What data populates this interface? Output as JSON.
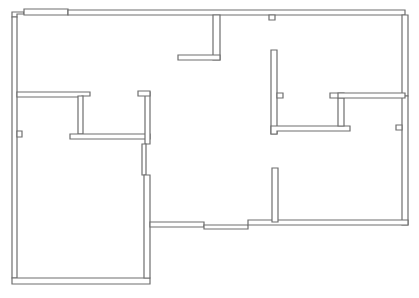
{
  "diagram": {
    "type": "floor-plan",
    "width": 419,
    "height": 298,
    "colors": {
      "wall_stroke": "#6e6e6e",
      "wall_fill": "#ffffff",
      "background": "#ffffff"
    },
    "walls": [
      {
        "name": "top-wall-left-notch",
        "points": "12,12 24,12 24,14 17,14 17,17 12,17"
      },
      {
        "name": "top-wall-raised",
        "points": "24,9 68,9 68,15 24,15"
      },
      {
        "name": "top-wall-main",
        "points": "68,10 405,10 405,15 68,15"
      },
      {
        "name": "right-wall-upper",
        "points": "402,15 408,15 408,96 402,96"
      },
      {
        "name": "right-wall-lower",
        "points": "402,96 408,96 408,225 402,225"
      },
      {
        "name": "left-wall",
        "points": "12,17 17,17 17,278 12,278"
      },
      {
        "name": "left-wall-jamb",
        "points": "17,131 22,131 22,137 17,137"
      },
      {
        "name": "bottom-wall-left",
        "points": "12,278 150,278 150,284 12,284"
      },
      {
        "name": "horizontal-wall-upper-left",
        "points": "17,92 90,92 90,96 82,96 82,97 17,97"
      },
      {
        "name": "closet-left-vertical",
        "points": "78,96 83,96 83,134 78,134"
      },
      {
        "name": "closet-bottom",
        "points": "70,134 150,134 150,139 70,139"
      },
      {
        "name": "closet-right-vertical",
        "points": "145,92 150,92 150,144 145,144"
      },
      {
        "name": "closet-right-cap",
        "points": "138,91 150,91 150,96 138,96"
      },
      {
        "name": "central-left-jamb-upper",
        "points": "142,144 146,144 146,175 142,175"
      },
      {
        "name": "central-left-vertical",
        "points": "144,175 150,175 150,278 144,278"
      },
      {
        "name": "bottom-hall-wall",
        "points": "150,222 204,222 204,227 150,227"
      },
      {
        "name": "bottom-door-threshold",
        "points": "204,225 248,225 248,229 204,229"
      },
      {
        "name": "bottom-wall-right",
        "points": "248,220 408,220 408,225 248,225"
      },
      {
        "name": "bottom-right-stub",
        "points": "272,168 278,168 278,222 272,222"
      },
      {
        "name": "upper-center-vertical",
        "points": "213,15 220,15 220,60 213,60"
      },
      {
        "name": "upper-center-horizontal",
        "points": "178,55 220,55 220,60 178,60"
      },
      {
        "name": "top-wall-jamb",
        "points": "269,15 275,15 275,20 269,20"
      },
      {
        "name": "right-closet-vertical",
        "points": "271,50 277,50 277,134 271,134"
      },
      {
        "name": "right-closet-jamb",
        "points": "277,93 283,93 283,98 277,98"
      },
      {
        "name": "right-closet-bottom",
        "points": "271,126 350,126 350,131 277,131 277,134 271,134"
      },
      {
        "name": "right-closet-right-vertical",
        "points": "338,96 344,96 344,126 338,126"
      },
      {
        "name": "right-closet-cap",
        "points": "330,93 344,93 344,98 330,98"
      },
      {
        "name": "right-room-top",
        "points": "338,93 405,93 405,98 338,98"
      },
      {
        "name": "right-wall-jamb",
        "points": "396,125 402,125 402,130 396,130"
      }
    ]
  }
}
